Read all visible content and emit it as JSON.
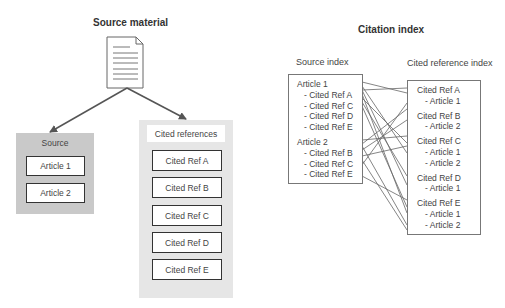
{
  "left": {
    "title": "Source material",
    "document_icon": "document-icon",
    "source_panel": {
      "label": "Source",
      "items": [
        "Article 1",
        "Article 2"
      ]
    },
    "cited_panel": {
      "label": "Cited references",
      "items": [
        "Cited Ref A",
        "Cited Ref B",
        "Cited Ref C",
        "Cited Ref D",
        "Cited Ref E"
      ]
    }
  },
  "right": {
    "title": "Citation index",
    "source_index": {
      "label": "Source index",
      "lines": [
        {
          "text": "Article 1",
          "indent": false
        },
        {
          "text": "- Cited Ref A",
          "indent": true
        },
        {
          "text": "- Cited Ref C",
          "indent": true
        },
        {
          "text": "- Cited Ref D",
          "indent": true
        },
        {
          "text": "- Cited Ref E",
          "indent": true
        },
        {
          "text": "Article 2",
          "indent": false
        },
        {
          "text": "- Cited Ref B",
          "indent": true
        },
        {
          "text": "- Cited Ref C",
          "indent": true
        },
        {
          "text": "- Cited Ref E",
          "indent": true
        }
      ]
    },
    "cited_index": {
      "label": "Cited reference index",
      "lines": [
        {
          "text": "Cited Ref A",
          "indent": false
        },
        {
          "text": "- Article 1",
          "indent": true
        },
        {
          "text": "Cited Ref B",
          "indent": false
        },
        {
          "text": "- Article 2",
          "indent": true
        },
        {
          "text": "Cited Ref C",
          "indent": false
        },
        {
          "text": "- Article 1",
          "indent": true
        },
        {
          "text": "- Article 2",
          "indent": true
        },
        {
          "text": "Cited Ref D",
          "indent": false
        },
        {
          "text": "- Article 1",
          "indent": true
        },
        {
          "text": "Cited Ref E",
          "indent": false
        },
        {
          "text": "- Article 1",
          "indent": true
        },
        {
          "text": "- Article 2",
          "indent": true
        }
      ]
    }
  },
  "colors": {
    "panel_dark": "#c9c9c9",
    "panel_light": "#e6e6e6",
    "line": "#555555"
  }
}
